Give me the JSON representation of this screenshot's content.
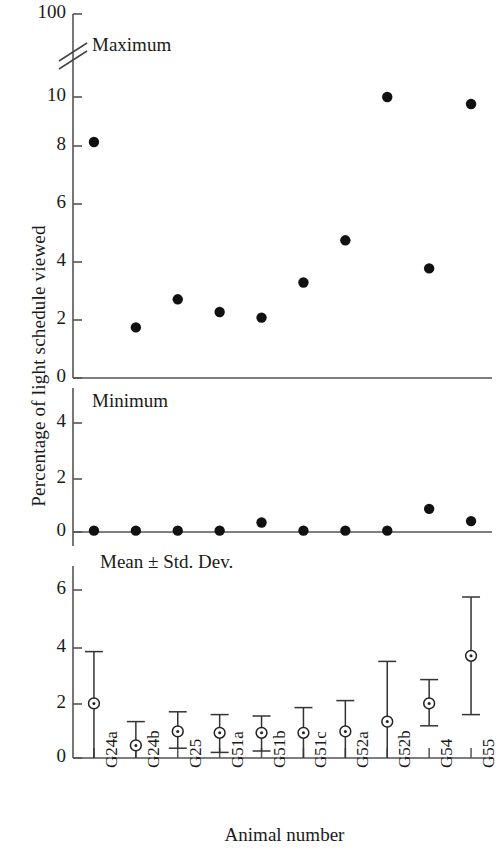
{
  "chart_data": {
    "type": "scatter",
    "title": "",
    "xlabel": "Animal number",
    "ylabel": "Percentage of light schedule viewed",
    "categories": [
      "G24a",
      "G24b",
      "G25",
      "G51a",
      "G51b",
      "G51c",
      "G52a",
      "G52b",
      "G54",
      "G55"
    ],
    "grid": false,
    "legend": "none",
    "panels": [
      {
        "name": "Maximum",
        "label": "Maximum",
        "marker": "filled-circle",
        "axis_break": true,
        "axis_break_note": "double-slash break between 10 and 100",
        "ticks": [
          0,
          2,
          4,
          6,
          8,
          10,
          100
        ],
        "tick_labels": [
          "0",
          "2",
          "4",
          "6",
          "8",
          "10",
          "100"
        ],
        "ylim": [
          0,
          100
        ],
        "values": [
          8.4,
          1.8,
          2.8,
          2.35,
          2.15,
          3.4,
          4.9,
          10.0,
          3.9,
          9.75
        ]
      },
      {
        "name": "Minimum",
        "label": "Minimum",
        "marker": "filled-circle",
        "axis_break": false,
        "ticks": [
          0,
          2,
          4
        ],
        "tick_labels": [
          "0",
          "2",
          "4"
        ],
        "ylim": [
          0,
          5.6
        ],
        "values": [
          0.05,
          0.05,
          0.05,
          0.05,
          0.35,
          0.05,
          0.05,
          0.05,
          0.85,
          0.4
        ]
      },
      {
        "name": "Mean ± Std. Dev.",
        "label": "Mean ± Std. Dev.",
        "marker": "open-circle-with-dot",
        "axis_break": false,
        "ticks": [
          0,
          2,
          4,
          6
        ],
        "tick_labels": [
          "0",
          "2",
          "4",
          "6"
        ],
        "ylim": [
          0,
          7.2
        ],
        "values": [
          1.95,
          0.45,
          0.95,
          0.9,
          0.9,
          0.9,
          0.95,
          1.3,
          1.95,
          3.65
        ],
        "error_upper": [
          3.8,
          1.3,
          1.65,
          1.55,
          1.5,
          1.8,
          2.05,
          3.45,
          2.8,
          5.75
        ],
        "error_lower": [
          0.0,
          0.0,
          0.35,
          0.2,
          0.25,
          0.0,
          0.0,
          0.0,
          1.15,
          1.55
        ]
      }
    ]
  },
  "axis": {
    "x_title": "Animal number",
    "y_title": "Percentage of light schedule viewed"
  },
  "colors": {
    "marker": "#111111",
    "axis": "#555555",
    "text": "#1a1a1a",
    "background": "#ffffff"
  }
}
